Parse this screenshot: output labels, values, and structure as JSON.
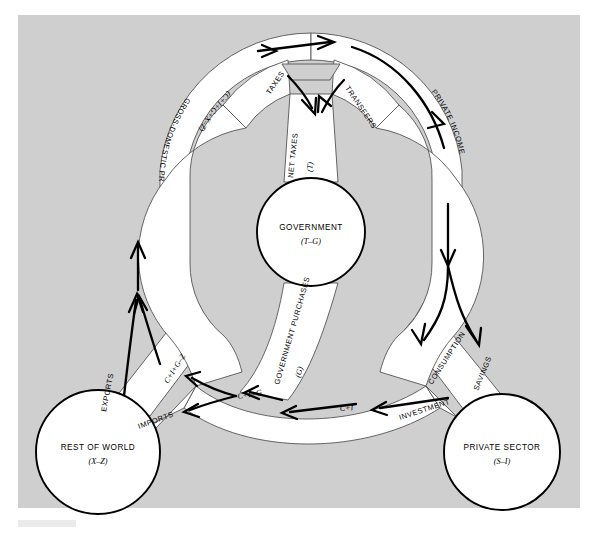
{
  "figure": {
    "kind": "circular-flow-diagram",
    "background_color": "#cfcfcf",
    "page_color": "#ffffff",
    "pipe_fill": "#ffffff",
    "stroke_color": "#000000"
  },
  "nodes": [
    {
      "id": "government",
      "label": "GOVERNMENT",
      "sublabel": "(T–G)",
      "cx": 311,
      "cy": 232,
      "r": 54
    },
    {
      "id": "rest-of-world",
      "label": "REST OF WORLD",
      "sublabel": "(X–Z)",
      "cx": 98,
      "cy": 452,
      "r": 62
    },
    {
      "id": "private-sector",
      "label": "PRIVATE SECTOR",
      "sublabel": "(S–I)",
      "cx": 502,
      "cy": 452,
      "r": 58
    }
  ],
  "flows": [
    {
      "id": "gross-domestic-product",
      "label": "GROSS-DOMESTIC PRODUCT",
      "equation": "(C+I+G+X–Z)"
    },
    {
      "id": "taxes",
      "label": "TAXES",
      "equation": ""
    },
    {
      "id": "transfers",
      "label": "TRANSFERS",
      "equation": ""
    },
    {
      "id": "net-taxes",
      "label": "NET TAXES",
      "equation": "(T)"
    },
    {
      "id": "private-income",
      "label": "PRIVATE INCOME",
      "equation": ""
    },
    {
      "id": "savings",
      "label": "SAVINGS",
      "equation": ""
    },
    {
      "id": "consumption",
      "label": "CONSUMPTION",
      "equation": ""
    },
    {
      "id": "investment",
      "label": "INVESTMENT",
      "equation": ""
    },
    {
      "id": "consumption-investment",
      "label": "",
      "equation": "C+I"
    },
    {
      "id": "government-purchases",
      "label": "GOVERNMENT PURCHASES",
      "equation": "(G)"
    },
    {
      "id": "domestic-demand",
      "label": "",
      "equation": "C+I+G"
    },
    {
      "id": "imports",
      "label": "IMPORTS",
      "equation": ""
    },
    {
      "id": "exports",
      "label": "EXPORTS",
      "equation": ""
    },
    {
      "id": "net-of-imports",
      "label": "",
      "equation": "C+I+G–Z"
    }
  ]
}
